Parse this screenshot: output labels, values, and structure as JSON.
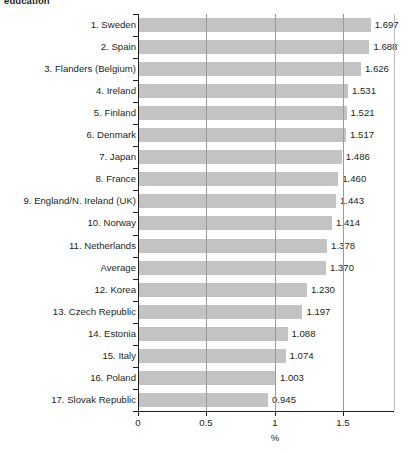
{
  "caption_fragment": "education",
  "chart_data": {
    "type": "bar",
    "orientation": "horizontal",
    "title": "",
    "subtitle": "",
    "xlabel": "%",
    "ylabel": "",
    "xlim": [
      0,
      1.8
    ],
    "xticks": [
      0,
      0.5,
      1,
      1.5
    ],
    "xtick_labels": [
      "0",
      "0.5",
      "1",
      "1.5"
    ],
    "grid": "vertical",
    "legend": "none",
    "bar_color": "#c3c3c3",
    "axis_color": "#231f20",
    "gridline_color": "#9a9a9a",
    "categories": [
      "1. Sweden",
      "2. Spain",
      "3. Flanders (Belgium)",
      "4. Ireland",
      "5. Finland",
      "6. Denmark",
      "7. Japan",
      "8. France",
      "9. England/N. Ireland (UK)",
      "10. Norway",
      "11. Netherlands",
      "Average",
      "12. Korea",
      "13. Czech Republic",
      "14. Estonia",
      "15. Italy",
      "16. Poland",
      "17. Slovak Republic"
    ],
    "values": [
      1.697,
      1.688,
      1.626,
      1.531,
      1.521,
      1.517,
      1.486,
      1.46,
      1.443,
      1.414,
      1.378,
      1.37,
      1.23,
      1.197,
      1.088,
      1.074,
      1.003,
      0.945
    ],
    "value_labels": [
      "1.697",
      "1.688",
      "1.626",
      "1.531",
      "1.521",
      "1.517",
      "1.486",
      "1.460",
      "1.443",
      "1.414",
      "1.378",
      "1.370",
      "1.230",
      "1.197",
      "1.088",
      "1.074",
      "1.003",
      "0.945"
    ]
  }
}
